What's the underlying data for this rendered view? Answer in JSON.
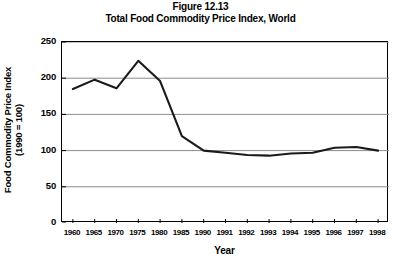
{
  "figure": {
    "title_line_1": "Figure 12.13",
    "title_line_2": "Total Food Commodity Price Index, World"
  },
  "chart_data": {
    "type": "line",
    "subtitle": "Total Food Commodity Price Index, World",
    "xlabel": "Year",
    "ylabel": "Food Commodity Price Index (1990 = 100)",
    "ylabel_line_1": "Food Commodity Price Index",
    "ylabel_line_2": "(1990 = 100)",
    "categories": [
      "1960",
      "1965",
      "1970",
      "1975",
      "1980",
      "1985",
      "1990",
      "1991",
      "1992",
      "1993",
      "1994",
      "1995",
      "1996",
      "1997",
      "1998"
    ],
    "values": [
      185,
      198,
      186,
      224,
      196,
      120,
      100,
      97,
      94,
      93,
      96,
      97,
      104,
      105,
      100
    ],
    "series": [
      {
        "name": "Total Food Commodity Price Index",
        "values": [
          185,
          198,
          186,
          224,
          196,
          120,
          100,
          97,
          94,
          93,
          96,
          97,
          104,
          105,
          100
        ]
      }
    ],
    "ylim": [
      0,
      250
    ],
    "yticks": [
      0,
      50,
      100,
      150,
      200,
      250
    ],
    "ytick_labels": [
      "0",
      "50",
      "100",
      "150",
      "200",
      "250"
    ],
    "xtick_labels": [
      "1960",
      "1965",
      "1970",
      "1975",
      "1980",
      "1985",
      "1990",
      "1991",
      "1992",
      "1993",
      "1994",
      "1995",
      "1996",
      "1997",
      "1998"
    ],
    "grid": "horizontal",
    "legend": "none",
    "line_color": "#1a1a1a",
    "grid_color": "#8c8c8c",
    "axis_color": "#000000",
    "background": "#ffffff"
  }
}
